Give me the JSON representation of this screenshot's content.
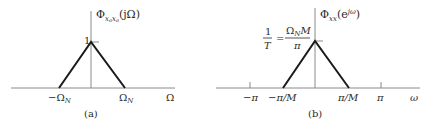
{
  "panel_a": {
    "caption": "(a)",
    "title": {
      "base": "Φ",
      "sub": "x",
      "subsub": "a",
      "sub2": "x",
      "subsub2": "a",
      "arg": "(jΩ)"
    },
    "peak_label": "1",
    "x_ticks": [
      {
        "label": "−Ω",
        "sub": "N",
        "value": "-Omega_N"
      },
      {
        "label": "Ω",
        "sub": "N",
        "value": "Omega_N"
      }
    ],
    "x_axis_label": "Ω"
  },
  "panel_b": {
    "caption": "(b)",
    "title": {
      "base": "Φ",
      "sub": "xx",
      "arg_open": "(e",
      "sup": "jω",
      "arg_close": ")"
    },
    "peak_label": {
      "lhs_num": "1",
      "lhs_den": "T",
      "eq": "=",
      "rhs_num_a": "Ω",
      "rhs_num_sub": "N",
      "rhs_num_b": "M",
      "rhs_den": "π"
    },
    "x_ticks": [
      {
        "label": "−π"
      },
      {
        "label": "−π/M"
      },
      {
        "label": "π/M"
      },
      {
        "label": "π"
      }
    ],
    "x_axis_label": "ω"
  },
  "colors": {
    "axis": "#7a7a7a",
    "triangle": "#1a1a1a",
    "text": "#2a2a2a"
  }
}
